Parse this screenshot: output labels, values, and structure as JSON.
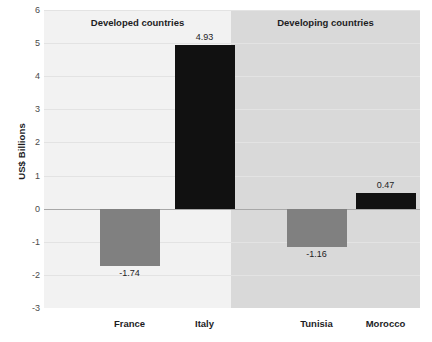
{
  "chart_data": {
    "type": "bar",
    "title": "",
    "xlabel": "",
    "ylabel": "US$ Billions",
    "ylim": [
      -3,
      6
    ],
    "yticks": [
      6,
      5,
      4,
      3,
      2,
      1,
      0,
      -1,
      -2,
      -3
    ],
    "ytick_labels": [
      "6",
      "5",
      "4",
      "3",
      "2",
      "1",
      "0",
      "-1",
      "-2",
      "-3"
    ],
    "grid": true,
    "legend": "none",
    "categories": [
      "France",
      "Italy",
      "Tunisia",
      "Morocco"
    ],
    "values": [
      -1.74,
      4.93,
      -1.16,
      0.47
    ],
    "value_labels": [
      "-1.74",
      "4.93",
      "-1.16",
      "0.47"
    ],
    "panels": [
      {
        "label": "Developed countries",
        "categories": [
          "France",
          "Italy"
        ],
        "values": [
          -1.74,
          4.93
        ]
      },
      {
        "label": "Developing countries",
        "categories": [
          "Tunisia",
          "Morocco"
        ],
        "values": [
          -1.16,
          0.47
        ]
      }
    ],
    "bars": [
      {
        "category": "France",
        "value": -1.74,
        "label": "-1.74",
        "sign": "negative",
        "panel": "Developed countries",
        "color": "#808080"
      },
      {
        "category": "Italy",
        "value": 4.93,
        "label": "4.93",
        "sign": "positive",
        "panel": "Developed countries",
        "color": "#111111"
      },
      {
        "category": "Tunisia",
        "value": -1.16,
        "label": "-1.16",
        "sign": "negative",
        "panel": "Developing countries",
        "color": "#808080"
      },
      {
        "category": "Morocco",
        "value": 0.47,
        "label": "0.47",
        "sign": "positive",
        "panel": "Developing countries",
        "color": "#111111"
      }
    ],
    "colors": {
      "positive_bar": "#111111",
      "negative_bar": "#808080",
      "panel_developed_bg": "#f2f2f2",
      "panel_developing_bg": "#d9d9d9",
      "gridline": "#e3e3e3",
      "zero_line": "#a8a8a8",
      "text": "#1d1d1f",
      "tick_text": "#4a4a4a"
    }
  }
}
